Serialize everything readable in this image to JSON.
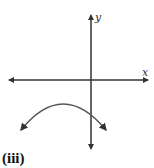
{
  "figure": {
    "x_axis_label": "x",
    "y_axis_label": "y",
    "caption": "(iii)",
    "curve": "downward-opening parabola with vertex in the third quadrant, arrows on both ends",
    "colors": {
      "axes": "#333333",
      "curve": "#555555"
    }
  }
}
